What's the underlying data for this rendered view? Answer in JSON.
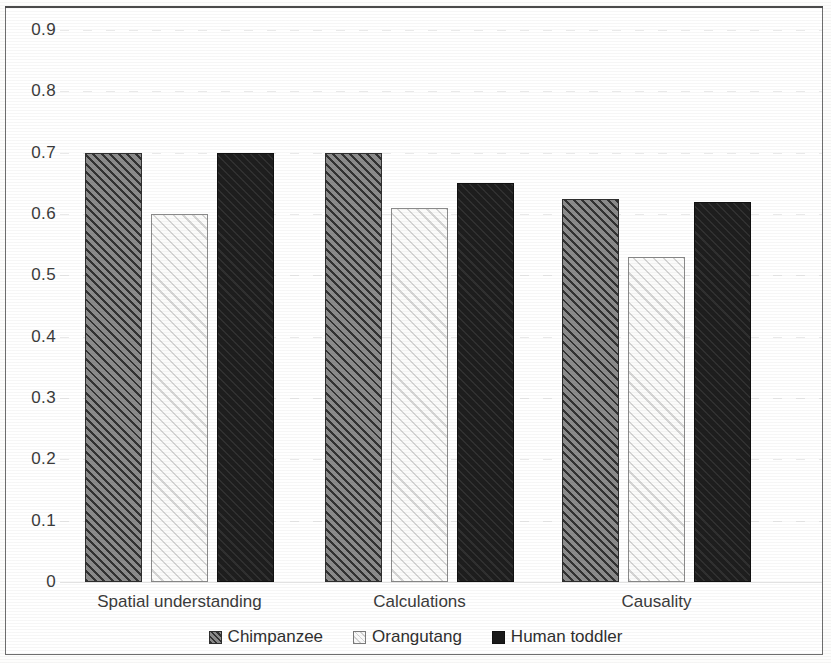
{
  "chart_data": {
    "type": "bar",
    "title": "",
    "subtitle": "",
    "xlabel": "",
    "ylabel": "",
    "categories": [
      "Spatial understanding",
      "Calculations",
      "Causality"
    ],
    "series": [
      {
        "name": "Chimpanzee",
        "values": [
          0.7,
          0.7,
          0.625
        ],
        "color": "#8b8b8b",
        "pattern": "diagonal-hatch-dark"
      },
      {
        "name": "Orangutang",
        "values": [
          0.6,
          0.61,
          0.53
        ],
        "color": "#fbfbfa",
        "pattern": "diagonal-hatch-light"
      },
      {
        "name": "Human toddler",
        "values": [
          0.7,
          0.65,
          0.62
        ],
        "color": "#1e1e1e",
        "pattern": "solid-dark"
      }
    ],
    "ylim": [
      0,
      0.9
    ],
    "ytick_labels": [
      "0.9",
      "0.8",
      "0.7",
      "0.6",
      "0.5",
      "0.4",
      "0.3",
      "0.2",
      "0.1",
      "0"
    ],
    "ytick_values": [
      0.9,
      0.8,
      0.7,
      0.6,
      0.5,
      0.4,
      0.3,
      0.2,
      0.1,
      0.0
    ],
    "grid": true,
    "grid_axis": "y",
    "legend_position": "bottom-center",
    "legend_entries": [
      "Chimpanzee",
      "Orangutang",
      "Human toddler"
    ],
    "annotations": []
  },
  "figure": {
    "border": true,
    "border_color": "#6e6e6e",
    "background": "#ffffff",
    "text_color": "#3b3b3b"
  }
}
